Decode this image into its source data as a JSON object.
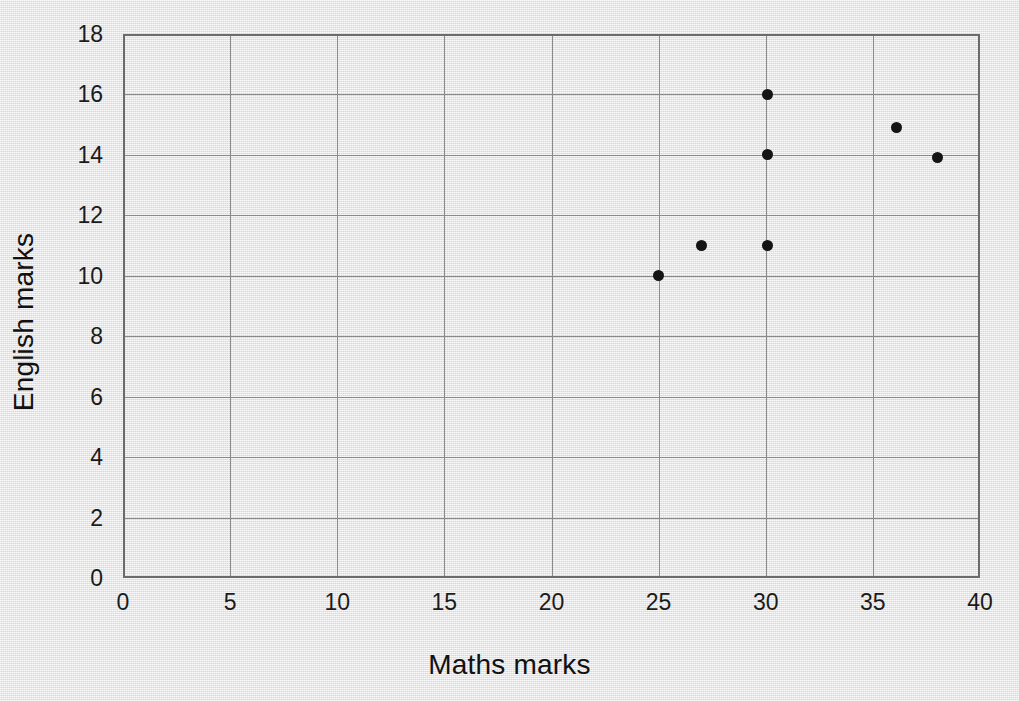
{
  "chart_data": {
    "type": "scatter",
    "title": "",
    "xlabel": "Maths marks",
    "ylabel": "English marks",
    "xlim": [
      0,
      40
    ],
    "ylim": [
      0,
      18
    ],
    "xticks": [
      0,
      5,
      10,
      15,
      20,
      25,
      30,
      35,
      40
    ],
    "yticks": [
      0,
      2,
      4,
      6,
      8,
      10,
      12,
      14,
      16,
      18
    ],
    "grid": true,
    "legend": "none",
    "marker": {
      "shape": "filled-circle",
      "color": "#141414",
      "size_px": 11
    },
    "colors": {
      "background": "#e4e4e4",
      "grid": "#8a8a8a",
      "frame": "#6b6b6b",
      "text": "#1b1b1b"
    },
    "points": [
      {
        "x": 25,
        "y": 10
      },
      {
        "x": 27,
        "y": 11
      },
      {
        "x": 30.1,
        "y": 11
      },
      {
        "x": 30.1,
        "y": 14
      },
      {
        "x": 30.1,
        "y": 16
      },
      {
        "x": 36.1,
        "y": 14.9
      },
      {
        "x": 38,
        "y": 13.9
      }
    ]
  }
}
